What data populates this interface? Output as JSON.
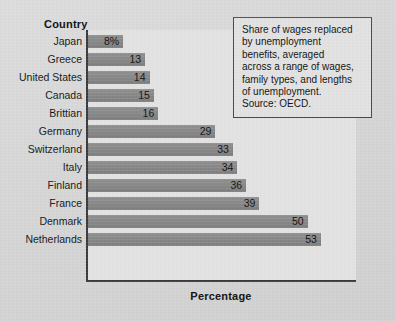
{
  "chart_data": {
    "type": "bar",
    "orientation": "horizontal",
    "title": "",
    "xlabel": "Percentage",
    "ylabel": "Country",
    "categories": [
      "Japan",
      "Greece",
      "United States",
      "Canada",
      "Brittian",
      "Germany",
      "Switzerland",
      "Italy",
      "Finland",
      "France",
      "Denmark",
      "Netherlands"
    ],
    "values": [
      8,
      13,
      14,
      15,
      16,
      29,
      33,
      34,
      36,
      39,
      50,
      53
    ],
    "value_labels": [
      "8%",
      "13",
      "14",
      "15",
      "16",
      "29",
      "33",
      "34",
      "36",
      "39",
      "50",
      "53"
    ],
    "xlim": [
      0,
      61
    ],
    "grid": false,
    "legend": null,
    "bar_color": "#888888",
    "axis_color": "#3a3a3a",
    "plot_background": "#e2e2e2",
    "figure_background": "#d6d6d6",
    "annotation": "Share of wages replaced by unemployment benefits, averaged across a range of wages, family types, and lengths of unemployment. Source: OECD."
  },
  "axes": {
    "category_axis_title": "Country",
    "value_axis_title": "Percentage"
  },
  "note": {
    "text": "Share of wages replaced\nby unemployment\nbenefits, averaged\nacross a range of wages,\nfamily types, and lengths\nof unemployment.\nSource: OECD."
  }
}
